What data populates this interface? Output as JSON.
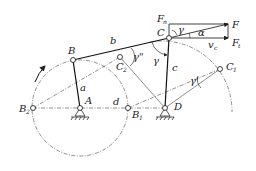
{
  "diagram": {
    "type": "four-bar linkage pressure angle diagram",
    "points": {
      "A": {
        "label": "A",
        "x": 80,
        "y": 108
      },
      "B": {
        "label": "B",
        "x": 73,
        "y": 60
      },
      "B1": {
        "label": "B",
        "sub": "1",
        "x": 128,
        "y": 108
      },
      "B2": {
        "label": "B",
        "sub": "2",
        "x": 33,
        "y": 108
      },
      "C": {
        "label": "C",
        "x": 169,
        "y": 38
      },
      "C1": {
        "label": "C",
        "sub": "1",
        "x": 220,
        "y": 69
      },
      "C2": {
        "label": "C",
        "sub": "2",
        "x": 120,
        "y": 57
      },
      "D": {
        "label": "D",
        "x": 165,
        "y": 108
      }
    },
    "links": {
      "a": "a",
      "b": "b",
      "c": "c",
      "d": "d"
    },
    "forces": {
      "F": "F",
      "Fn": {
        "label": "F",
        "sub": "n"
      },
      "Ft": {
        "label": "F",
        "sub": "t"
      },
      "vc": {
        "label": "v",
        "sub": "c"
      }
    },
    "angles": {
      "gamma": "γ",
      "gamma_dd": "γ\"",
      "gamma_d": "γ'",
      "alpha": "α"
    }
  }
}
